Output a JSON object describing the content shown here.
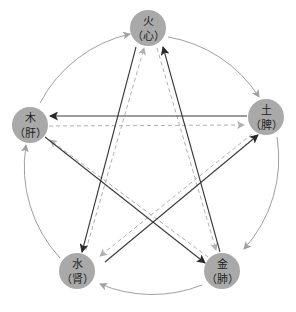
{
  "colors": {
    "node_fill": "#a9a9a9",
    "cycle_arc": "#a0a0a0",
    "control_line": "#3a3a3a",
    "insult_line": "#b0b0b0",
    "background": "#ffffff"
  },
  "nodes": [
    {
      "id": "fire",
      "element": "火",
      "organ": "（心）",
      "cx": 148,
      "cy": 28
    },
    {
      "id": "earth",
      "element": "土",
      "organ": "（脾）",
      "cx": 266,
      "cy": 117
    },
    {
      "id": "metal",
      "element": "金",
      "organ": "（肺）",
      "cx": 222,
      "cy": 271
    },
    {
      "id": "water",
      "element": "水",
      "organ": "（肾）",
      "cx": 77,
      "cy": 271
    },
    {
      "id": "wood",
      "element": "木",
      "organ": "（肝）",
      "cx": 30,
      "cy": 125
    }
  ],
  "generating_cycle": [
    {
      "from": "wood",
      "to": "fire"
    },
    {
      "from": "fire",
      "to": "earth"
    },
    {
      "from": "earth",
      "to": "metal"
    },
    {
      "from": "metal",
      "to": "water"
    },
    {
      "from": "water",
      "to": "wood"
    }
  ],
  "controlling_cycle": [
    {
      "from": "earth",
      "to": "wood"
    },
    {
      "from": "wood",
      "to": "metal"
    },
    {
      "from": "metal",
      "to": "fire"
    },
    {
      "from": "fire",
      "to": "water"
    },
    {
      "from": "water",
      "to": "earth"
    }
  ],
  "insulting_cycle": [
    {
      "from": "wood",
      "to": "earth"
    },
    {
      "from": "metal",
      "to": "wood"
    },
    {
      "from": "fire",
      "to": "metal"
    },
    {
      "from": "water",
      "to": "fire"
    },
    {
      "from": "earth",
      "to": "water"
    }
  ]
}
